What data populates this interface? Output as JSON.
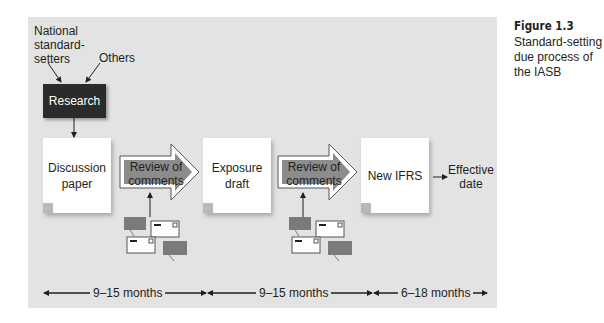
{
  "figure": {
    "number": "Figure 1.3",
    "caption_line1": "Standard-setting",
    "caption_line2": "due process of",
    "caption_line3": "the IASB"
  },
  "inputs": {
    "national_line1": "National",
    "national_line2": "standard-",
    "national_line3": "setters",
    "others": "Others"
  },
  "research": {
    "label": "Research"
  },
  "stages": [
    {
      "line1": "Discussion",
      "line2": "paper"
    },
    {
      "line1": "Exposure",
      "line2": "draft"
    },
    {
      "line1": "New IFRS",
      "line2": ""
    }
  ],
  "reviews": [
    {
      "line1": "Review of",
      "line2": "comments"
    },
    {
      "line1": "Review of",
      "line2": "comments"
    }
  ],
  "effective": {
    "line1": "Effective",
    "line2": "date"
  },
  "timeline": [
    {
      "label": "9–15 months"
    },
    {
      "label": "9–15 months"
    },
    {
      "label": "6–18 months"
    }
  ],
  "colors": {
    "panel": "#e3e3e3",
    "research_box": "#2b2b2b",
    "review_arrow_fill": "#8c8c8c",
    "comment_card": "#7a7a7a"
  }
}
